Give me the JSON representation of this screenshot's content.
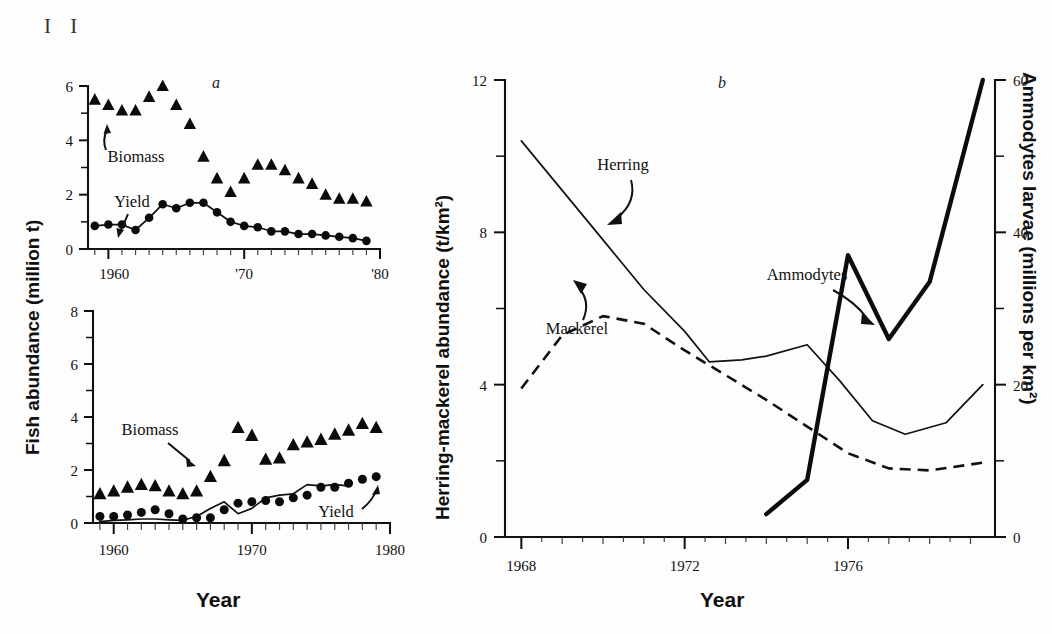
{
  "figure": {
    "corner_mark": "I I",
    "background_color": "#fdfdfd",
    "ink_color": "#111111"
  },
  "panel_a_top": {
    "letter": "a",
    "y_axis": {
      "title": "Fish abundance (million t)",
      "ticks_major": [
        0,
        2,
        4,
        6
      ],
      "tick_labels": [
        "0",
        "2",
        "4",
        "6"
      ],
      "ticks_minor": [
        1,
        3,
        5
      ],
      "range": [
        0,
        6
      ]
    },
    "x_axis": {
      "title": "Year",
      "tick_labels": [
        "1960",
        "'70",
        "'80"
      ],
      "tick_values": [
        1960,
        1970,
        1980
      ],
      "range": [
        1958.5,
        1980
      ]
    },
    "annotations": [
      {
        "label": "Biomass",
        "target": "biomass-series"
      },
      {
        "label": "Yield",
        "target": "yield-series"
      }
    ]
  },
  "panel_a_bottom": {
    "y_axis": {
      "title": "Fish abundance (million t)",
      "ticks_major": [
        0,
        2,
        4,
        6,
        8
      ],
      "tick_labels": [
        "0",
        "2",
        "4",
        "6",
        "8"
      ],
      "ticks_minor": [
        1,
        3,
        5,
        7
      ],
      "range": [
        0,
        8
      ]
    },
    "x_axis": {
      "title": "Year",
      "tick_labels": [
        "1960",
        "1970",
        "1980"
      ],
      "tick_values": [
        1960,
        1970,
        1980
      ],
      "range": [
        1958.5,
        1980
      ]
    },
    "annotations": [
      {
        "label": "Biomass",
        "target": "biomass-series"
      },
      {
        "label": "Yield",
        "target": "yield-series"
      }
    ]
  },
  "panel_b": {
    "letter": "b",
    "y_axis_left": {
      "title": "Herring-mackerel abundance (t/km²)",
      "ticks_major": [
        0,
        4,
        8,
        12
      ],
      "tick_labels": [
        "0",
        "4",
        "8",
        "12"
      ],
      "ticks_minor": [
        2,
        6,
        10
      ],
      "range": [
        0,
        12
      ]
    },
    "y_axis_right": {
      "title": "Ammodytes larvae (millions per km²)",
      "ticks_major": [
        0,
        20,
        40,
        60
      ],
      "tick_labels": [
        "0",
        "20",
        "40",
        "60"
      ],
      "ticks_minor": [
        10,
        30,
        50
      ],
      "range": [
        0,
        60
      ]
    },
    "x_axis": {
      "title": "Year",
      "tick_labels": [
        "1968",
        "1972",
        "1976"
      ],
      "tick_values": [
        1968,
        1972,
        1976
      ],
      "range": [
        1967.6,
        1979.6
      ]
    },
    "annotations": [
      {
        "label": "Herring",
        "target": "herring-series"
      },
      {
        "label": "Mackerel",
        "target": "mackerel-series"
      },
      {
        "label": "Ammodytes",
        "target": "ammodytes-series"
      }
    ]
  },
  "chart_data": [
    {
      "id": "panel-a-top",
      "type": "scatter",
      "title": "a",
      "xlabel": "Year",
      "ylabel": "Fish abundance (million t)",
      "xlim": [
        1958.5,
        1980
      ],
      "ylim": [
        0,
        6
      ],
      "grid": false,
      "legend": "inline-annotations",
      "series": [
        {
          "name": "Biomass",
          "marker": "triangle",
          "line": false,
          "x": [
            1959,
            1960,
            1961,
            1962,
            1963,
            1964,
            1965,
            1966,
            1967,
            1968,
            1969,
            1970,
            1971,
            1972,
            1973,
            1974,
            1975,
            1976,
            1977,
            1978,
            1979
          ],
          "y": [
            5.5,
            5.3,
            5.1,
            5.1,
            5.6,
            6.0,
            5.3,
            4.6,
            3.4,
            2.6,
            2.1,
            2.6,
            3.1,
            3.1,
            2.9,
            2.6,
            2.4,
            2.0,
            1.85,
            1.85,
            1.75
          ]
        },
        {
          "name": "Yield",
          "marker": "circle",
          "line": true,
          "x": [
            1959,
            1960,
            1961,
            1962,
            1963,
            1964,
            1965,
            1966,
            1967,
            1968,
            1969,
            1970,
            1971,
            1972,
            1973,
            1974,
            1975,
            1976,
            1977,
            1978,
            1979
          ],
          "y": [
            0.85,
            0.9,
            0.9,
            0.7,
            1.15,
            1.65,
            1.5,
            1.7,
            1.7,
            1.35,
            1.0,
            0.85,
            0.8,
            0.65,
            0.65,
            0.55,
            0.55,
            0.5,
            0.45,
            0.4,
            0.3
          ]
        }
      ]
    },
    {
      "id": "panel-a-bottom",
      "type": "scatter",
      "title": "",
      "xlabel": "Year",
      "ylabel": "Fish abundance (million t)",
      "xlim": [
        1958.5,
        1980
      ],
      "ylim": [
        0,
        8
      ],
      "grid": false,
      "legend": "inline-annotations",
      "series": [
        {
          "name": "Biomass",
          "marker": "triangle",
          "line": false,
          "x": [
            1959,
            1960,
            1961,
            1962,
            1963,
            1964,
            1965,
            1966,
            1967,
            1968,
            1969,
            1970,
            1971,
            1972,
            1973,
            1974,
            1975,
            1976,
            1977,
            1978,
            1979
          ],
          "y": [
            1.1,
            1.2,
            1.35,
            1.45,
            1.4,
            1.2,
            1.1,
            1.2,
            1.75,
            2.35,
            3.6,
            3.3,
            2.4,
            2.45,
            2.95,
            3.05,
            3.15,
            3.35,
            3.5,
            3.75,
            3.6
          ]
        },
        {
          "name": "Yield (points)",
          "marker": "circle",
          "line": false,
          "x": [
            1959,
            1960,
            1961,
            1962,
            1963,
            1964,
            1965,
            1966,
            1967,
            1968,
            1969,
            1970,
            1971,
            1972,
            1973,
            1974,
            1975,
            1976,
            1977,
            1978,
            1979
          ],
          "y": [
            0.25,
            0.25,
            0.3,
            0.4,
            0.5,
            0.35,
            0.15,
            0.2,
            0.2,
            0.5,
            0.75,
            0.8,
            0.85,
            0.8,
            0.95,
            1.05,
            1.35,
            1.35,
            1.5,
            1.65,
            1.75
          ]
        },
        {
          "name": "Yield (curve)",
          "marker": "none",
          "line": true,
          "x": [
            1959,
            1960,
            1961,
            1962,
            1963,
            1964,
            1965,
            1966,
            1967,
            1968,
            1969,
            1970,
            1971,
            1972,
            1973,
            1974,
            1975,
            1976,
            1977
          ],
          "y": [
            0.05,
            0.1,
            0.12,
            0.15,
            0.15,
            0.12,
            0.1,
            0.25,
            0.55,
            0.8,
            0.35,
            0.55,
            0.95,
            1.05,
            1.1,
            1.45,
            1.4,
            1.45,
            1.4
          ]
        }
      ]
    },
    {
      "id": "panel-b",
      "type": "line",
      "title": "b",
      "xlabel": "Year",
      "ylabel": "Herring-mackerel abundance (t/km²)",
      "ylabel_right": "Ammodytes larvae (millions per km²)",
      "xlim": [
        1967.6,
        1979.6
      ],
      "ylim": [
        0,
        12
      ],
      "ylim_right": [
        0,
        60
      ],
      "grid": false,
      "legend": "inline-annotations",
      "series": [
        {
          "name": "Herring",
          "axis": "left",
          "style": "solid-thin",
          "x": [
            1968.0,
            1969.0,
            1970.0,
            1971.0,
            1972.0,
            1972.6,
            1973.4,
            1974.0,
            1975.0,
            1975.8,
            1976.6,
            1977.4,
            1978.4,
            1979.3
          ],
          "y": [
            10.4,
            9.1,
            7.8,
            6.5,
            5.4,
            4.6,
            4.65,
            4.75,
            5.05,
            4.1,
            3.05,
            2.7,
            3.0,
            4.0
          ]
        },
        {
          "name": "Mackerel",
          "axis": "left",
          "style": "dashed",
          "x": [
            1968.0,
            1969.0,
            1970.0,
            1971.0,
            1972.0,
            1973.0,
            1974.0,
            1975.0,
            1976.0,
            1977.0,
            1978.0,
            1979.3
          ],
          "y": [
            3.9,
            5.3,
            5.8,
            5.6,
            4.9,
            4.25,
            3.6,
            2.9,
            2.2,
            1.8,
            1.75,
            1.95
          ]
        },
        {
          "name": "Ammodytes",
          "axis": "right",
          "style": "solid-thick",
          "x": [
            1974.0,
            1975.0,
            1976.0,
            1977.0,
            1978.0,
            1979.3
          ],
          "y": [
            3.0,
            7.5,
            37.0,
            26.0,
            33.5,
            60.0
          ]
        }
      ]
    }
  ]
}
